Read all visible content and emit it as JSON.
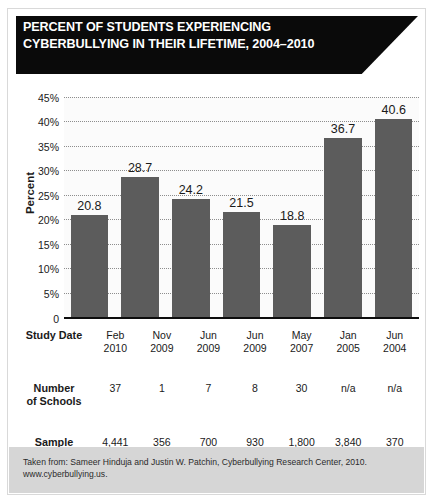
{
  "header": {
    "title_line1": "PERCENT OF STUDENTS EXPERIENCING",
    "title_line2": "CYBERBULLYING IN THEIR LIFETIME, 2004–2010"
  },
  "footer": {
    "line1": "Taken from: Sameer Hinduja and Justin W. Patchin, Cyberbullying Research Center, 2010.",
    "line2": "www.cyberbullying.us."
  },
  "table": {
    "row_date_label_1": "Study Date",
    "row_schools_label_1": "Number",
    "row_schools_label_2": "of Schools",
    "row_sample_label_1": "Sample",
    "row_sample_label_2": "Size"
  },
  "chart_data": {
    "type": "bar",
    "title": "PERCENT OF STUDENTS EXPERIENCING CYBERBULLYING IN THEIR LIFETIME, 2004–2010",
    "xlabel": "Study Date",
    "ylabel": "Percent",
    "ylim": [
      0,
      45
    ],
    "ytick_step": 5,
    "ytick_labels": [
      "45%",
      "40%",
      "35%",
      "30%",
      "25%",
      "20%",
      "15%",
      "10%",
      "5%",
      "0"
    ],
    "ytick_values": [
      45,
      40,
      35,
      30,
      25,
      20,
      15,
      10,
      5,
      0
    ],
    "grid": true,
    "legend": false,
    "bar_color": "#5c5c5c",
    "categories": [
      "Feb 2010",
      "Nov 2009",
      "Jun 2009",
      "Jun 2009",
      "May 2007",
      "Jan 2005",
      "Jun 2004"
    ],
    "category_lines": [
      [
        "Feb",
        "2010"
      ],
      [
        "Nov",
        "2009"
      ],
      [
        "Jun",
        "2009"
      ],
      [
        "Jun",
        "2009"
      ],
      [
        "May",
        "2007"
      ],
      [
        "Jan",
        "2005"
      ],
      [
        "Jun",
        "2004"
      ]
    ],
    "values": [
      20.8,
      28.7,
      24.2,
      21.5,
      18.8,
      36.7,
      40.6
    ],
    "value_labels": [
      "20.8",
      "28.7",
      "24.2",
      "21.5",
      "18.8",
      "36.7",
      "40.6"
    ],
    "number_of_schools": [
      "37",
      "1",
      "7",
      "8",
      "30",
      "n/a",
      "n/a"
    ],
    "sample_size": [
      "4,441",
      "356",
      "700",
      "930",
      "1,800",
      "3,840",
      "370"
    ]
  }
}
